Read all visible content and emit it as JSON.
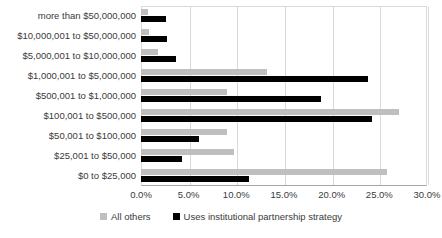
{
  "chart_data": {
    "type": "bar",
    "orientation": "horizontal",
    "title": "",
    "xlabel": "",
    "ylabel": "",
    "xlim": [
      0,
      30
    ],
    "xticks": [
      0,
      5,
      10,
      15,
      20,
      25,
      30
    ],
    "xtick_labels": [
      "0.0%",
      "5.0%",
      "10.0%",
      "15.0%",
      "20.0%",
      "25.0%",
      "30.0%"
    ],
    "grid": true,
    "legend_position": "bottom",
    "categories": [
      "more than $50,000,000",
      "$10,000,001 to $50,000,000",
      "$5,000,001 to $10,000,000",
      "$1,000,001 to $5,000,000",
      "$500,001 to $1,000,000",
      "$100,001 to $500,000",
      "$50,001 to $100,000",
      "$25,001 to $50,000",
      "$0 to $25,000"
    ],
    "series": [
      {
        "name": "All others",
        "color": "#bfbfbf",
        "values": [
          0.7,
          0.8,
          1.8,
          13.2,
          9.0,
          27.1,
          9.0,
          9.8,
          25.8
        ]
      },
      {
        "name": "Uses institutional partnership strategy",
        "color": "#000000",
        "values": [
          2.6,
          2.7,
          3.7,
          23.8,
          18.9,
          24.2,
          6.1,
          4.3,
          11.3
        ]
      }
    ]
  },
  "legend": {
    "entries": [
      {
        "label": "All others",
        "color": "#bfbfbf"
      },
      {
        "label": "Uses institutional partnership strategy",
        "color": "#000000"
      }
    ]
  }
}
